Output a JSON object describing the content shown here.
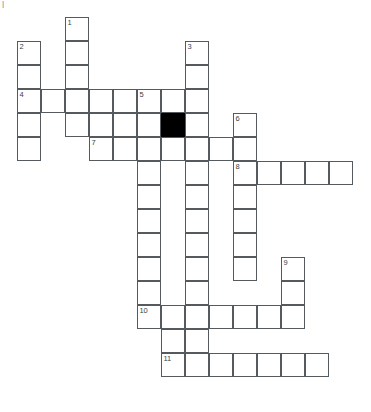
{
  "puzzle": {
    "type": "crossword-grid",
    "title": "Crossword Puzzle Grid",
    "geometry": {
      "cell_size_px": 24,
      "origin_x_px": 17,
      "origin_y_px": 17,
      "columns": 14,
      "rows": 17,
      "border_color": "#555a5e",
      "cell_fill": "#ffffff",
      "blocked_fill": "#000000",
      "page_background": "#ffffff",
      "number_color": "#3b3f42"
    },
    "clue_numbers": [
      {
        "label": "1",
        "col": 2,
        "row": 0
      },
      {
        "label": "2",
        "col": 0,
        "row": 1
      },
      {
        "label": "3",
        "col": 7,
        "row": 1
      },
      {
        "label": "4",
        "col": 0,
        "row": 3
      },
      {
        "label": "5",
        "col": 5,
        "row": 3
      },
      {
        "label": "6",
        "col": 9,
        "row": 4
      },
      {
        "label": "7",
        "col": 3,
        "row": 5
      },
      {
        "label": "8",
        "col": 9,
        "row": 6
      },
      {
        "label": "9",
        "col": 11,
        "row": 10
      },
      {
        "label": "10",
        "col": 5,
        "row": 12
      },
      {
        "label": "11",
        "col": 6,
        "row": 14
      }
    ],
    "entries": [
      {
        "number": "1",
        "direction": "down",
        "col": 2,
        "row": 0,
        "length": 6
      },
      {
        "number": "2",
        "direction": "down",
        "col": 0,
        "row": 1,
        "length": 5
      },
      {
        "number": "3",
        "direction": "down",
        "col": 7,
        "row": 1,
        "length": 5
      },
      {
        "number": "4",
        "direction": "across",
        "col": 0,
        "row": 3,
        "length": 8
      },
      {
        "number": "5",
        "direction": "down",
        "col": 5,
        "row": 3,
        "length": 10
      },
      {
        "number": "6",
        "direction": "down",
        "col": 9,
        "row": 4,
        "length": 8
      },
      {
        "number": "7",
        "direction": "across",
        "col": 3,
        "row": 5,
        "length": 7
      },
      {
        "number": "8",
        "direction": "across",
        "col": 9,
        "row": 6,
        "length": 5
      },
      {
        "number": "9",
        "direction": "down",
        "col": 11,
        "row": 10,
        "length": 3
      },
      {
        "number": "10",
        "direction": "across",
        "col": 5,
        "row": 12,
        "length": 7
      },
      {
        "number": "11",
        "direction": "across",
        "col": 6,
        "row": 14,
        "length": 7
      }
    ],
    "open_cells": [
      {
        "col": 2,
        "row": 0
      },
      {
        "col": 0,
        "row": 1
      },
      {
        "col": 2,
        "row": 1
      },
      {
        "col": 7,
        "row": 1
      },
      {
        "col": 0,
        "row": 2
      },
      {
        "col": 2,
        "row": 2
      },
      {
        "col": 7,
        "row": 2
      },
      {
        "col": 0,
        "row": 3
      },
      {
        "col": 1,
        "row": 3
      },
      {
        "col": 2,
        "row": 3
      },
      {
        "col": 3,
        "row": 3
      },
      {
        "col": 4,
        "row": 3
      },
      {
        "col": 5,
        "row": 3
      },
      {
        "col": 6,
        "row": 3
      },
      {
        "col": 7,
        "row": 3
      },
      {
        "col": 0,
        "row": 4
      },
      {
        "col": 2,
        "row": 4
      },
      {
        "col": 3,
        "row": 4
      },
      {
        "col": 4,
        "row": 4
      },
      {
        "col": 5,
        "row": 4
      },
      {
        "col": 6,
        "row": 4
      },
      {
        "col": 7,
        "row": 4
      },
      {
        "col": 9,
        "row": 4
      },
      {
        "col": 0,
        "row": 5
      },
      {
        "col": 3,
        "row": 5
      },
      {
        "col": 4,
        "row": 5
      },
      {
        "col": 5,
        "row": 5
      },
      {
        "col": 6,
        "row": 5
      },
      {
        "col": 7,
        "row": 5
      },
      {
        "col": 8,
        "row": 5
      },
      {
        "col": 9,
        "row": 5
      },
      {
        "col": 5,
        "row": 6
      },
      {
        "col": 7,
        "row": 6
      },
      {
        "col": 9,
        "row": 6
      },
      {
        "col": 10,
        "row": 6
      },
      {
        "col": 11,
        "row": 6
      },
      {
        "col": 12,
        "row": 6
      },
      {
        "col": 13,
        "row": 6
      },
      {
        "col": 5,
        "row": 7
      },
      {
        "col": 7,
        "row": 7
      },
      {
        "col": 9,
        "row": 7
      },
      {
        "col": 5,
        "row": 8
      },
      {
        "col": 7,
        "row": 8
      },
      {
        "col": 9,
        "row": 8
      },
      {
        "col": 5,
        "row": 9
      },
      {
        "col": 7,
        "row": 9
      },
      {
        "col": 9,
        "row": 9
      },
      {
        "col": 5,
        "row": 10
      },
      {
        "col": 7,
        "row": 10
      },
      {
        "col": 9,
        "row": 10
      },
      {
        "col": 11,
        "row": 10
      },
      {
        "col": 5,
        "row": 11
      },
      {
        "col": 7,
        "row": 11
      },
      {
        "col": 11,
        "row": 11
      },
      {
        "col": 5,
        "row": 12
      },
      {
        "col": 6,
        "row": 12
      },
      {
        "col": 7,
        "row": 12
      },
      {
        "col": 8,
        "row": 12
      },
      {
        "col": 9,
        "row": 12
      },
      {
        "col": 10,
        "row": 12
      },
      {
        "col": 11,
        "row": 12
      },
      {
        "col": 6,
        "row": 13
      },
      {
        "col": 7,
        "row": 13
      },
      {
        "col": 6,
        "row": 14
      },
      {
        "col": 7,
        "row": 14
      },
      {
        "col": 8,
        "row": 14
      },
      {
        "col": 9,
        "row": 14
      },
      {
        "col": 10,
        "row": 14
      },
      {
        "col": 11,
        "row": 14
      },
      {
        "col": 12,
        "row": 14
      }
    ],
    "blocked_cells": [
      {
        "col": 6,
        "row": 4
      }
    ],
    "corner_marks": [
      {
        "text": "|",
        "x": 2,
        "y": 1
      }
    ]
  }
}
